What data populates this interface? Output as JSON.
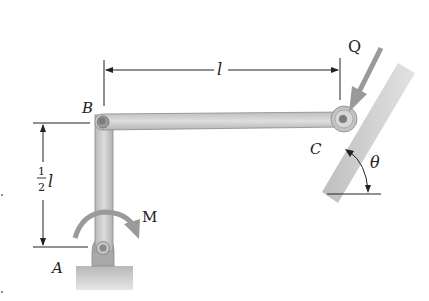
{
  "diagram": {
    "points": {
      "A": "A",
      "B": "B",
      "C": "C"
    },
    "loads": {
      "force": "Q",
      "moment": "M"
    },
    "angle": "θ",
    "dimensions": {
      "horizontal": "l",
      "vertical_num": "1",
      "vertical_den": "2",
      "vertical_var": "l"
    },
    "colors": {
      "bar_fill": "#c9c9c9",
      "bar_edge": "#8a8a8a",
      "arrow_fill": "#9a9a9a",
      "line": "#222222",
      "incline_fill": "#cfcfcf"
    }
  }
}
